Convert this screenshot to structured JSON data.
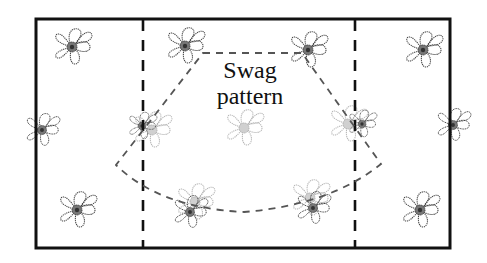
{
  "diagram": {
    "title_line1": "Swag",
    "title_line2": "pattern",
    "colors": {
      "border": "#111111",
      "dash": "#222222",
      "swag_dash": "#555555",
      "flower": "#444444",
      "flower_faded": "#aaaaaa",
      "background": "#ffffff"
    },
    "elements": {
      "fabric_panel": "rectangle",
      "fold_lines": [
        "left-dashed-vertical",
        "right-dashed-vertical"
      ],
      "swag_outline": "dashed fan/arc shape",
      "motif": "flower-icon"
    }
  }
}
